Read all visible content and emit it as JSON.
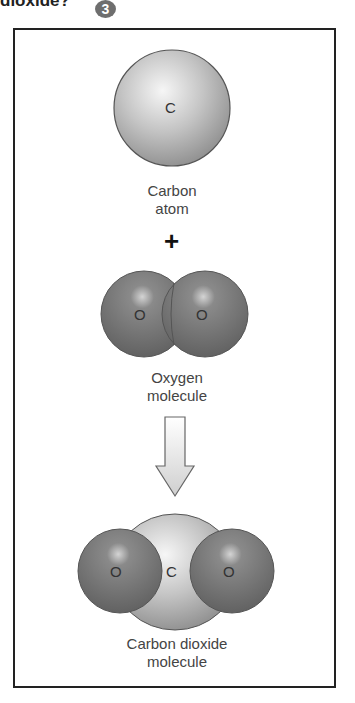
{
  "header": {
    "title_fragment": "dioxide?",
    "badge": "3"
  },
  "diagram": {
    "carbon_atom": {
      "symbol": "C",
      "label_line1": "Carbon",
      "label_line2": "atom"
    },
    "operator": "+",
    "oxygen_molecule": {
      "atom1": "O",
      "atom2": "O",
      "label_line1": "Oxygen",
      "label_line2": "molecule"
    },
    "arrow": "down-arrow-icon",
    "co2_molecule": {
      "left": "O",
      "center": "C",
      "right": "O",
      "label_line1": "Carbon dioxide",
      "label_line2": "molecule"
    }
  },
  "colors": {
    "carbon": "#c8c8c8",
    "oxygen": "#7a7a7a",
    "frame": "#222222",
    "badge": "#6e6e6e"
  }
}
